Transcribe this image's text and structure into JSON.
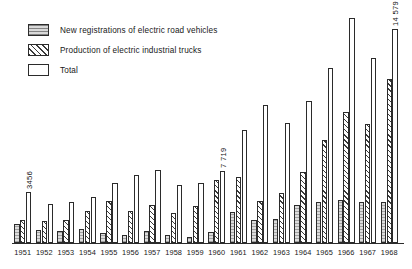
{
  "legend": {
    "items": [
      {
        "label": "New registrations of electric road vehicles",
        "swatch": "dotted-gray-swatch"
      },
      {
        "label": "Production of electric industrial trucks",
        "swatch": "diagonal-hatch-swatch"
      },
      {
        "label": "Total",
        "swatch": "empty-outline-swatch"
      }
    ]
  },
  "annotations": [
    {
      "text": "3456",
      "year": "1951"
    },
    {
      "text": "7 719",
      "year": "1960"
    },
    {
      "text": "14 579",
      "year": "1968"
    }
  ],
  "chart_data": {
    "type": "bar",
    "title": "",
    "xlabel": "",
    "ylabel": "",
    "grid": false,
    "legend_position": "top-left",
    "ylim": [
      0,
      16000
    ],
    "categories": [
      "1951",
      "1952",
      "1953",
      "1954",
      "1955",
      "1956",
      "1957",
      "1958",
      "1959",
      "1960",
      "1961",
      "1962",
      "1963",
      "1964",
      "1965",
      "1966",
      "1967",
      "1968"
    ],
    "series": [
      {
        "name": "New registrations of electric road vehicles",
        "values": [
          1290,
          890,
          830,
          930,
          690,
          560,
          790,
          560,
          440,
          760,
          2100,
          1590,
          1650,
          2600,
          2800,
          2900,
          2800,
          2800
        ]
      },
      {
        "name": "Production of electric industrial trucks",
        "values": [
          1540,
          1500,
          1580,
          2170,
          2870,
          2180,
          2580,
          2060,
          2520,
          4260,
          4520,
          2830,
          3380,
          4840,
          7000,
          8900,
          8100,
          11200
        ]
      },
      {
        "name": "Total",
        "values": [
          3456,
          2690,
          2760,
          3120,
          4100,
          4600,
          4980,
          3930,
          4110,
          4930,
          7719,
          9400,
          8200,
          9640,
          11900,
          15300,
          12600,
          14579
        ]
      }
    ]
  }
}
